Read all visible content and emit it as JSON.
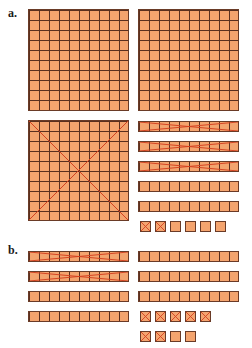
{
  "labels": {
    "a": "a.",
    "b": "b."
  },
  "colors": {
    "fill": "#f4a46e",
    "border": "#6a3b27",
    "cross": "#d2401f"
  },
  "section_a": {
    "hundreds": [
      {
        "id": "flat-1",
        "crossed": false
      },
      {
        "id": "flat-2",
        "crossed": false
      },
      {
        "id": "flat-3",
        "crossed": true
      }
    ],
    "tens": [
      {
        "crossed": true
      },
      {
        "crossed": true
      },
      {
        "crossed": true
      },
      {
        "crossed": false
      },
      {
        "crossed": false
      }
    ],
    "ones": [
      {
        "crossed": true
      },
      {
        "crossed": true
      },
      {
        "crossed": false
      },
      {
        "crossed": false
      },
      {
        "crossed": false
      },
      {
        "crossed": false
      }
    ]
  },
  "section_b": {
    "tens_left": [
      {
        "crossed": true
      },
      {
        "crossed": true
      },
      {
        "crossed": false
      },
      {
        "crossed": false
      }
    ],
    "tens_right": [
      {
        "crossed": false
      },
      {
        "crossed": false
      },
      {
        "crossed": false
      }
    ],
    "ones_row1": [
      {
        "crossed": true
      },
      {
        "crossed": true
      },
      {
        "crossed": true
      },
      {
        "crossed": true
      },
      {
        "crossed": true
      }
    ],
    "ones_row2": [
      {
        "crossed": true
      },
      {
        "crossed": true
      },
      {
        "crossed": false
      },
      {
        "crossed": false
      }
    ]
  }
}
